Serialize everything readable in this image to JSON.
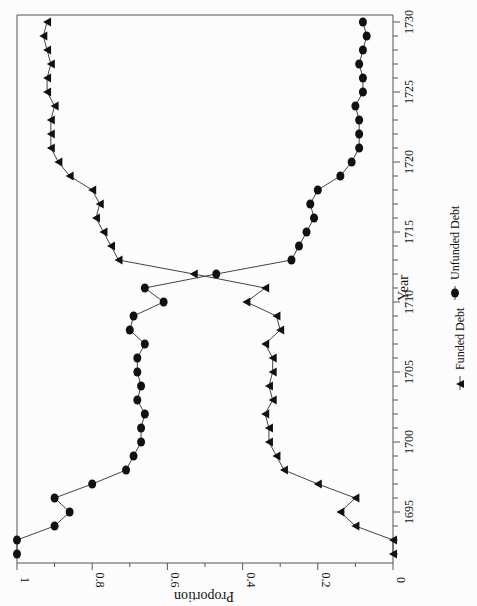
{
  "chart_data": {
    "type": "line",
    "orientation": "rotated-90-clockwise",
    "title": "",
    "xlabel": "Year",
    "ylabel": "Proportion",
    "xlim": [
      1692,
      1730
    ],
    "ylim": [
      0,
      1
    ],
    "x_ticks": [
      "1695",
      "1700",
      "1705",
      "1710",
      "1715",
      "1720",
      "1725",
      "1730"
    ],
    "y_ticks": [
      "0",
      "0.2",
      "0.4",
      "0.6",
      "0.8",
      "1"
    ],
    "grid": false,
    "legend_position": "bottom",
    "x": [
      1692,
      1693,
      1694,
      1695,
      1696,
      1697,
      1698,
      1699,
      1700,
      1701,
      1702,
      1703,
      1704,
      1705,
      1706,
      1707,
      1708,
      1709,
      1710,
      1711,
      1712,
      1713,
      1714,
      1715,
      1716,
      1717,
      1718,
      1719,
      1720,
      1721,
      1722,
      1723,
      1724,
      1725,
      1726,
      1727,
      1728,
      1729,
      1730
    ],
    "series": [
      {
        "name": "Funded Debt",
        "marker": "triangle",
        "values": [
          0.0,
          0.0,
          0.1,
          0.14,
          0.1,
          0.2,
          0.29,
          0.31,
          0.33,
          0.33,
          0.34,
          0.32,
          0.33,
          0.32,
          0.32,
          0.34,
          0.3,
          0.31,
          0.39,
          0.34,
          0.53,
          0.73,
          0.75,
          0.77,
          0.79,
          0.78,
          0.8,
          0.86,
          0.89,
          0.91,
          0.91,
          0.91,
          0.9,
          0.92,
          0.92,
          0.91,
          0.92,
          0.93,
          0.92
        ]
      },
      {
        "name": "Unfunded Debt",
        "marker": "circle",
        "values": [
          1.0,
          1.0,
          0.9,
          0.86,
          0.9,
          0.8,
          0.71,
          0.69,
          0.67,
          0.67,
          0.66,
          0.68,
          0.67,
          0.68,
          0.68,
          0.66,
          0.7,
          0.69,
          0.61,
          0.66,
          0.47,
          0.27,
          0.25,
          0.23,
          0.21,
          0.22,
          0.2,
          0.14,
          0.11,
          0.09,
          0.09,
          0.09,
          0.1,
          0.08,
          0.08,
          0.09,
          0.08,
          0.07,
          0.08
        ]
      }
    ]
  },
  "legend": {
    "funded_label": "Funded Debt",
    "unfunded_label": "Unfunded Debt"
  },
  "axes": {
    "x_title": "Year",
    "y_title": "Proportion"
  }
}
